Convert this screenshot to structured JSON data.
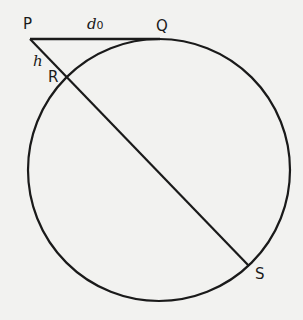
{
  "diagram": {
    "type": "geometry",
    "colors": {
      "background": "#f2f2f0",
      "stroke": "#1a1a1a"
    },
    "points": {
      "P": {
        "label": "P",
        "x": 30,
        "y": 39
      },
      "Q": {
        "label": "Q",
        "x": 159,
        "y": 39
      },
      "R": {
        "label": "R",
        "x": 68,
        "y": 78
      },
      "S": {
        "label": "S",
        "x": 249,
        "y": 266
      }
    },
    "circle": {
      "cx": 159,
      "cy": 170,
      "r": 131
    },
    "segment_labels": {
      "PQ": {
        "main": "d",
        "sub": "0"
      },
      "PR": {
        "main": "h"
      }
    }
  }
}
